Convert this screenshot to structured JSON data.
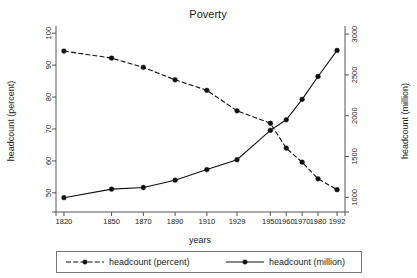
{
  "chart_data": {
    "type": "line",
    "title": "Poverty",
    "xlabel": "years",
    "ylabel": "headcount (percent)",
    "y2label": "headcount (million)",
    "grid": false,
    "legend_position": "bottom",
    "categories": [
      "1820",
      "1850",
      "1870",
      "1890",
      "1910",
      "1929",
      "1950",
      "1960",
      "1970",
      "1980",
      "1992"
    ],
    "x": [
      1820,
      1850,
      1870,
      1890,
      1910,
      1929,
      1950,
      1960,
      1970,
      1980,
      1992
    ],
    "xticklabels": [
      "1820",
      "1850",
      "1870",
      "1890",
      "1910",
      "1929",
      "1950",
      "1960",
      "1970",
      "1980",
      "1992"
    ],
    "yticklabels": [
      "50",
      "60",
      "70",
      "80",
      "90",
      "100"
    ],
    "yticks": [
      50,
      60,
      70,
      80,
      90,
      100
    ],
    "ylim": [
      44,
      101
    ],
    "y2ticklabels": [
      "1000",
      "1500",
      "2000",
      "2500",
      "3000"
    ],
    "y2ticks": [
      1000,
      1500,
      2000,
      2500,
      3000
    ],
    "y2lim": [
      820,
      3050
    ],
    "series": [
      {
        "name": "headcount (percent)",
        "axis": "left",
        "style": "dashed",
        "marker": "circle",
        "color": "#111111",
        "values": [
          94.4,
          92.2,
          89.3,
          85.4,
          82.1,
          75.7,
          71.8,
          64.0,
          59.6,
          54.4,
          51.0
        ]
      },
      {
        "name": "headcount (million)",
        "axis": "right",
        "style": "solid",
        "marker": "circle",
        "color": "#111111",
        "values": [
          995,
          1100,
          1120,
          1210,
          1340,
          1460,
          1820,
          1950,
          2200,
          2480,
          2800
        ]
      }
    ]
  },
  "legend": {
    "items": [
      {
        "label": "headcount (percent)",
        "style": "dashed"
      },
      {
        "label": "headcount (million)",
        "style": "solid"
      }
    ]
  }
}
